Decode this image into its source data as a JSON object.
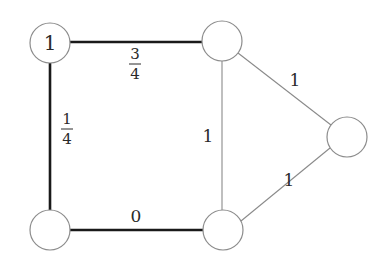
{
  "diagram": {
    "type": "weighted-graph",
    "nodes": [
      {
        "id": "A",
        "label": "1",
        "x": 50,
        "y": 43
      },
      {
        "id": "B",
        "label": "",
        "x": 222,
        "y": 41
      },
      {
        "id": "C",
        "label": "",
        "x": 347,
        "y": 137
      },
      {
        "id": "D",
        "label": "",
        "x": 50,
        "y": 230
      },
      {
        "id": "E",
        "label": "",
        "x": 223,
        "y": 230
      }
    ],
    "edges": [
      {
        "from": "A",
        "to": "B",
        "weight": "3/4",
        "num": "3",
        "den": "4",
        "style": "thick"
      },
      {
        "from": "A",
        "to": "D",
        "weight": "1/4",
        "num": "1",
        "den": "4",
        "style": "thick"
      },
      {
        "from": "D",
        "to": "E",
        "weight": "0",
        "style": "thick"
      },
      {
        "from": "B",
        "to": "E",
        "weight": "1",
        "style": "thin"
      },
      {
        "from": "B",
        "to": "C",
        "weight": "1",
        "style": "thin"
      },
      {
        "from": "E",
        "to": "C",
        "weight": "1",
        "style": "thin"
      }
    ]
  },
  "colors": {
    "thick_edge": "#1a1a1a",
    "thin_edge": "#8a8a8a",
    "node_stroke": "#8c8c8c",
    "text": "#2a2a2a"
  }
}
